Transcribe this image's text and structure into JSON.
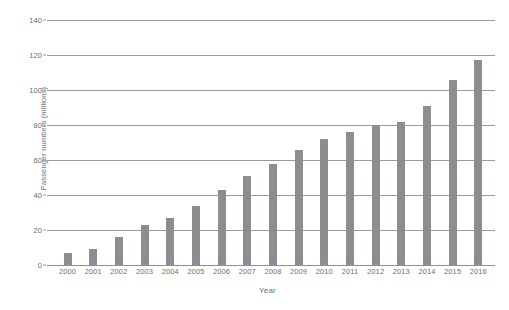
{
  "chart_data": {
    "type": "bar",
    "title": "",
    "xlabel": "Year",
    "ylabel": "Passenger numbers (millions)",
    "categories": [
      "2000",
      "2001",
      "2002",
      "2003",
      "2004",
      "2005",
      "2006",
      "2007",
      "2008",
      "2009",
      "2010",
      "2011",
      "2012",
      "2013",
      "2014",
      "2015",
      "2016"
    ],
    "values": [
      7,
      9,
      16,
      23,
      27,
      34,
      43,
      51,
      58,
      66,
      72,
      76,
      80,
      82,
      91,
      106,
      117
    ],
    "series": [
      {
        "name": "Passenger numbers",
        "values": [
          7,
          9,
          16,
          23,
          27,
          34,
          43,
          51,
          58,
          66,
          72,
          76,
          80,
          82,
          91,
          106,
          117
        ]
      }
    ],
    "ylim": [
      0,
      140
    ],
    "yticks": [
      0,
      20,
      40,
      60,
      80,
      100,
      120,
      140
    ],
    "ytick_labels": [
      "0",
      "20",
      "40",
      "60",
      "80",
      "100",
      "120",
      "140"
    ],
    "grid": true,
    "grid_axis": "y",
    "legend": false,
    "legend_position": "none",
    "bar_color": "#8c8d90",
    "grid_color": "#9a9b9e",
    "text_color": "#6d6e71",
    "background_color": "#ffffff"
  }
}
